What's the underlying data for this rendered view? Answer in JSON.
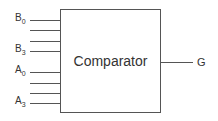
{
  "block": {
    "label": "Comparator"
  },
  "inputs": [
    {
      "name": "B",
      "sub": "0",
      "labeled": true
    },
    {
      "name": "",
      "sub": "",
      "labeled": false
    },
    {
      "name": "",
      "sub": "",
      "labeled": false
    },
    {
      "name": "B",
      "sub": "3",
      "labeled": true
    },
    {
      "name": "A",
      "sub": "0",
      "labeled": true
    },
    {
      "name": "",
      "sub": "",
      "labeled": false
    },
    {
      "name": "",
      "sub": "",
      "labeled": false
    },
    {
      "name": "A",
      "sub": "3",
      "labeled": true
    }
  ],
  "output": {
    "name": "G"
  }
}
